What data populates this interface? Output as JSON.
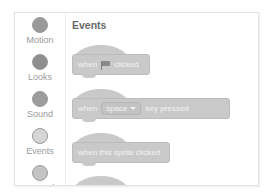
{
  "sidebar": {
    "categories": [
      {
        "label": "Motion",
        "color": "#9a9a9a"
      },
      {
        "label": "Looks",
        "color": "#8e8e8e"
      },
      {
        "label": "Sound",
        "color": "#9c9c9c"
      },
      {
        "label": "Events",
        "color": "#d6d6d6"
      },
      {
        "label": "Control",
        "color": "#c4c4c4"
      }
    ]
  },
  "palette": {
    "title": "Events",
    "blocks": [
      {
        "type": "when-flag-clicked",
        "prefix": "when",
        "icon": "green-flag-icon",
        "suffix": "clicked"
      },
      {
        "type": "when-key-pressed",
        "prefix": "when",
        "dropdown": "space",
        "suffix": "key pressed"
      },
      {
        "type": "when-sprite-clicked",
        "text": "when this sprite clicked"
      }
    ]
  }
}
